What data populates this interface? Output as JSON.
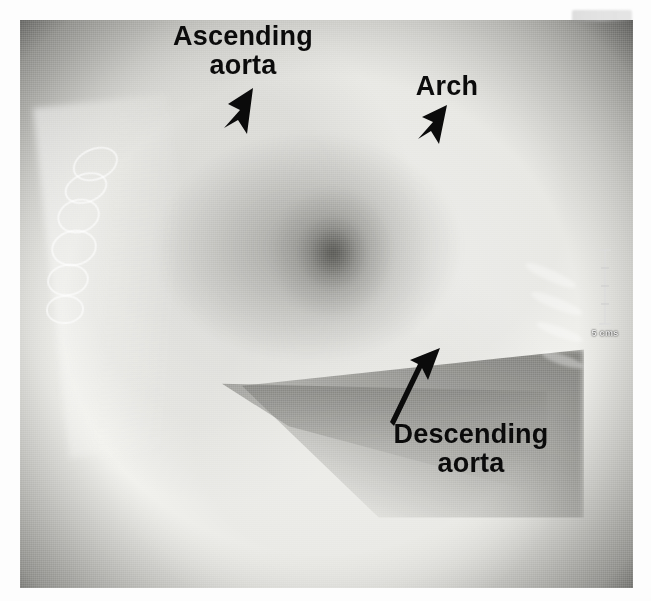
{
  "image": {
    "kind": "lateral-chest-radiograph",
    "description": "Lateral chest X-ray with labelled aortic segments",
    "plate": {
      "left": 20,
      "top": 20,
      "width": 613,
      "height": 568
    },
    "background_color": "#ffffff",
    "film_dark_color": "#0a0a0a",
    "annotation_color": "#0b0b0b"
  },
  "annotations": [
    {
      "id": "ascending-aorta",
      "line1": "Ascending",
      "line2": "aorta",
      "arrow_direction": "down-left",
      "arrow_from": [
        250,
        90
      ],
      "arrow_to": [
        224,
        136
      ]
    },
    {
      "id": "arch",
      "line1": "Arch",
      "line2": "",
      "arrow_direction": "down-left",
      "arrow_from": [
        443,
        106
      ],
      "arrow_to": [
        419,
        141
      ]
    },
    {
      "id": "descending-aorta",
      "line1": "Descending",
      "line2": "aorta",
      "arrow_direction": "up-right",
      "arrow_from": [
        390,
        424
      ],
      "arrow_to": [
        441,
        352
      ]
    }
  ],
  "scale_bar": {
    "label": "5 cms",
    "ticks": 5,
    "orientation": "vertical",
    "color": "#e8e8e8"
  },
  "corner_marking": {
    "present": true,
    "legible": false,
    "text": ""
  }
}
